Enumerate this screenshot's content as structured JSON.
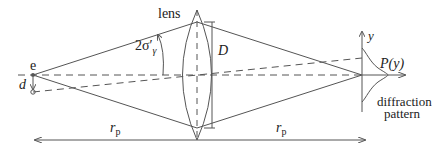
{
  "diagram": {
    "labels": {
      "lens": "lens",
      "angle": "2σ′",
      "angle_sub": "γ",
      "source": "e",
      "displacement": "d",
      "aperture": "D",
      "y_axis": "y",
      "intensity": "P(y)",
      "pattern_line1": "diffraction",
      "pattern_line2": "pattern",
      "distance_left": "r",
      "distance_left_sub": "p",
      "distance_right": "r",
      "distance_right_sub": "p"
    },
    "colors": {
      "line": "#555555",
      "text": "#222222",
      "background": "#ffffff"
    }
  }
}
